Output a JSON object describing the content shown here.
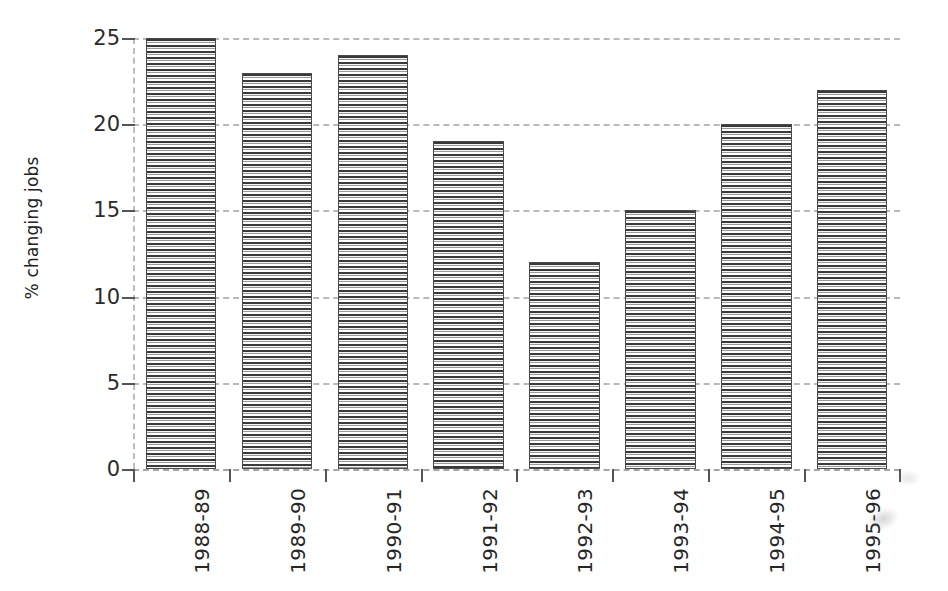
{
  "chart_data": {
    "type": "bar",
    "title": "",
    "subtitle": "",
    "xlabel": "",
    "ylabel": "% changing jobs",
    "categories": [
      "1988-89",
      "1989-90",
      "1990-91",
      "1991-92",
      "1992-93",
      "1993-94",
      "1994-95",
      "1995-96"
    ],
    "values": [
      25,
      23,
      24,
      19,
      12,
      15,
      20,
      22
    ],
    "ylim": [
      0,
      25
    ],
    "ytick_labels": [
      "0",
      "5",
      "10",
      "15",
      "20",
      "25"
    ],
    "ytick_values": [
      0,
      5,
      10,
      15,
      20,
      25
    ],
    "grid": true,
    "grid_style": "dashed-horizontal",
    "legend": null,
    "legend_position": "none",
    "bar_fill": "horizontal-hatch",
    "bar_edge_color": "#4a4a4a",
    "axis_color": "#555555",
    "gridline_color": "#b9b9b9",
    "background": "#ffffff"
  },
  "axis": {
    "y_title": "% changing jobs"
  }
}
